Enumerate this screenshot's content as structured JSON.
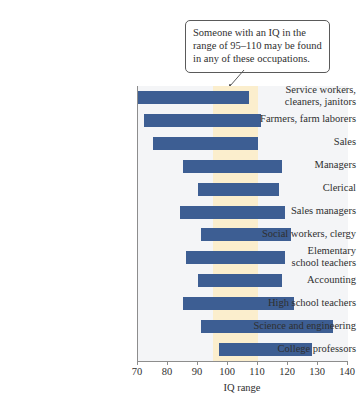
{
  "annotation": {
    "name": "iq-range-callout",
    "lines": [
      "Someone with an IQ in the",
      "range of 95–110 may be found",
      "in any of these occupations."
    ],
    "bracket_range": [
      95,
      110
    ]
  },
  "colors": {
    "bar": "#3d5e93",
    "highlight_band": "#fbeecd",
    "plot_background": "#f4f5f7",
    "axis": "#8d8d8d",
    "text": "#2f2f2f",
    "callout_border": "#5a5a5a"
  },
  "chart_data": {
    "type": "bar",
    "orientation": "horizontal",
    "title": "",
    "xlabel": "IQ range",
    "ylabel": "",
    "xlim": [
      70,
      140
    ],
    "xticks": [
      70,
      80,
      90,
      100,
      110,
      120,
      130,
      140
    ],
    "xtick_labels": [
      "70",
      "80",
      "90",
      "100",
      "110",
      "120",
      "130",
      "140"
    ],
    "grid": false,
    "legend": null,
    "highlight_band": {
      "start": 95,
      "end": 110,
      "label": "95–110"
    },
    "categories": [
      "Service workers, cleaners, janitors",
      "Farmers, farm laborers",
      "Sales",
      "Managers",
      "Clerical",
      "Sales managers",
      "Social workers, clergy",
      "Elementary school teachers",
      "Accounting",
      "High school teachers",
      "Science and engineering",
      "College professors"
    ],
    "category_lines": [
      [
        "Service workers,",
        "cleaners, janitors"
      ],
      [
        "Farmers, farm laborers"
      ],
      [
        "Sales"
      ],
      [
        "Managers"
      ],
      [
        "Clerical"
      ],
      [
        "Sales managers"
      ],
      [
        "Social workers, clergy"
      ],
      [
        "Elementary",
        "school teachers"
      ],
      [
        "Accounting"
      ],
      [
        "High school teachers"
      ],
      [
        "Science and engineering"
      ],
      [
        "College professors"
      ]
    ],
    "ranges": [
      {
        "category": "Service workers, cleaners, janitors",
        "low": 70,
        "high": 107
      },
      {
        "category": "Farmers, farm laborers",
        "low": 72,
        "high": 111
      },
      {
        "category": "Sales",
        "low": 75,
        "high": 110
      },
      {
        "category": "Managers",
        "low": 85,
        "high": 118
      },
      {
        "category": "Clerical",
        "low": 90,
        "high": 117
      },
      {
        "category": "Sales managers",
        "low": 84,
        "high": 119
      },
      {
        "category": "Social workers, clergy",
        "low": 91,
        "high": 121
      },
      {
        "category": "Elementary school teachers",
        "low": 86,
        "high": 119
      },
      {
        "category": "Accounting",
        "low": 90,
        "high": 118
      },
      {
        "category": "High school teachers",
        "low": 85,
        "high": 122
      },
      {
        "category": "Science and engineering",
        "low": 91,
        "high": 135
      },
      {
        "category": "College professors",
        "low": 97,
        "high": 128
      }
    ]
  }
}
